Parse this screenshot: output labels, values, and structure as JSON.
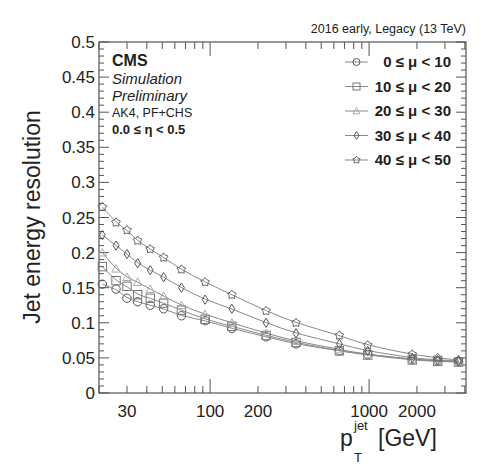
{
  "chart_data": {
    "type": "scatter",
    "title": "",
    "top_right_label": "2016 early, Legacy (13 TeV)",
    "annotations": {
      "experiment": "CMS",
      "line1": "Simulation",
      "line2": "Preliminary",
      "line3": "AK4, PF+CHS",
      "line4": "0.0 ≤ η < 0.5"
    },
    "xlabel": "p_T^jet [GeV]",
    "xlabel_main": "p",
    "xlabel_sub": "T",
    "xlabel_sup": "jet",
    "xlabel_unit": "[GeV]",
    "ylabel": "Jet energy resolution",
    "xscale": "log",
    "xlim": [
      20,
      4070
    ],
    "ylim": [
      0,
      0.5
    ],
    "x_ticks": [
      30,
      100,
      200,
      1000,
      2000
    ],
    "x_tick_labels": [
      "30",
      "100",
      "200",
      "1000",
      "2000"
    ],
    "y_ticks": [
      0,
      0.05,
      0.1,
      0.15,
      0.2,
      0.25,
      0.3,
      0.35,
      0.4,
      0.45,
      0.5
    ],
    "y_tick_labels": [
      "0",
      "0.05",
      "0.1",
      "0.15",
      "0.2",
      "0.25",
      "0.3",
      "0.35",
      "0.4",
      "0.45",
      "0.5"
    ],
    "grid": false,
    "legend_position": "top-right",
    "x": [
      21,
      25.6,
      30,
      35,
      42,
      51,
      66,
      93,
      137,
      225,
      347,
      650,
      980,
      1870,
      2700,
      3650
    ],
    "series": [
      {
        "name": "0 ≤ μ < 10",
        "marker": "circle",
        "color": "#555555",
        "values": [
          0.155,
          0.148,
          0.135,
          0.13,
          0.125,
          0.12,
          0.11,
          0.103,
          0.092,
          0.08,
          0.07,
          0.06,
          0.055,
          0.048,
          0.046,
          0.045
        ]
      },
      {
        "name": "10 ≤ μ < 20",
        "marker": "square",
        "color": "#777777",
        "values": [
          0.18,
          0.16,
          0.152,
          0.14,
          0.135,
          0.128,
          0.118,
          0.105,
          0.095,
          0.082,
          0.072,
          0.06,
          0.054,
          0.047,
          0.045,
          0.044
        ]
      },
      {
        "name": "20 ≤ μ < 30",
        "marker": "triangle",
        "color": "#aaaaaa",
        "values": [
          0.2,
          0.177,
          0.165,
          0.158,
          0.148,
          0.138,
          0.125,
          0.112,
          0.1,
          0.085,
          0.074,
          0.062,
          0.055,
          0.048,
          0.046,
          0.045
        ]
      },
      {
        "name": "30 ≤ μ < 40",
        "marker": "diamond",
        "color": "#555555",
        "values": [
          0.225,
          0.21,
          0.198,
          0.185,
          0.175,
          0.165,
          0.15,
          0.133,
          0.12,
          0.1,
          0.085,
          0.07,
          0.06,
          0.05,
          0.047,
          0.046
        ]
      },
      {
        "name": "40 ≤ μ < 50",
        "marker": "star",
        "color": "#666666",
        "values": [
          0.265,
          0.243,
          0.232,
          0.217,
          0.205,
          0.193,
          0.176,
          0.158,
          0.14,
          0.117,
          0.1,
          0.082,
          0.068,
          0.055,
          0.05,
          0.047
        ]
      }
    ]
  }
}
